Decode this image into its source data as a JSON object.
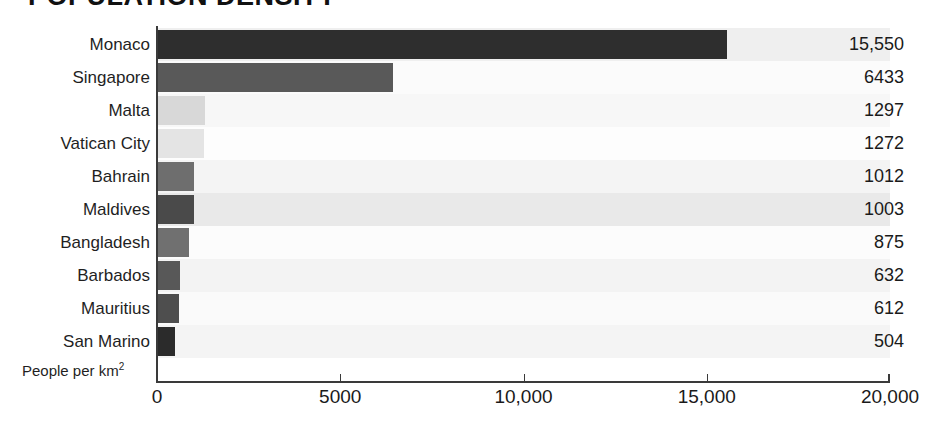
{
  "chart_data": {
    "type": "bar",
    "orientation": "horizontal",
    "title": "POPULATION DENSITY",
    "xlabel": "People per km",
    "xlabel_superscript": "2",
    "ylabel": "",
    "categories": [
      "Monaco",
      "Singapore",
      "Malta",
      "Vatican City",
      "Bahrain",
      "Maldives",
      "Bangladesh",
      "Barbados",
      "Mauritius",
      "San Marino"
    ],
    "values": [
      15550,
      6433,
      1297,
      1272,
      1012,
      1003,
      875,
      632,
      612,
      504
    ],
    "value_labels": [
      "15,550",
      "6433",
      "1297",
      "1272",
      "1012",
      "1003",
      "875",
      "632",
      "612",
      "504"
    ],
    "bar_colors": [
      "#2e2e2e",
      "#595959",
      "#d8d8d8",
      "#e4e4e4",
      "#6e6e6e",
      "#4a4a4a",
      "#707070",
      "#585858",
      "#4e4e4e",
      "#2b2b2b"
    ],
    "row_band_colors": [
      "#efefef",
      "#fbfbfb",
      "#f7f7f7",
      "#fdfdfd",
      "#f4f4f4",
      "#e9e9e9",
      "#fcfcfc",
      "#f3f3f3",
      "#fafafa",
      "#f4f4f4"
    ],
    "xlim": [
      0,
      20000
    ],
    "xticks": [
      0,
      5000,
      10000,
      15000,
      20000
    ],
    "xtick_labels": [
      "0",
      "5000",
      "10,000",
      "15,000",
      "20,000"
    ],
    "grid": false,
    "legend": false,
    "axis_color": "#3a3a3a"
  }
}
